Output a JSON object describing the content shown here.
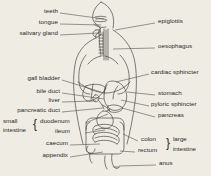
{
  "figure": {
    "background_color": "#efece4",
    "ink_color": "#2a2724",
    "orientation": "anterior view of human torso with alimentary canal"
  },
  "labels_left": [
    {
      "id": "teeth",
      "text": "teeth",
      "x": 40,
      "y": 11,
      "leader_to_x": 104,
      "leader_to_y": 19
    },
    {
      "id": "tongue",
      "text": "tongue",
      "x": 36,
      "y": 22,
      "leader_to_x": 101,
      "leader_to_y": 25
    },
    {
      "id": "salivary-gland",
      "text": "salivary gland",
      "x": 11,
      "y": 33,
      "leader_to_x": 99,
      "leader_to_y": 33
    },
    {
      "id": "gall-bladder",
      "text": "gall bladder",
      "x": 17,
      "y": 78,
      "leader_to_x": 101,
      "leader_to_y": 92
    },
    {
      "id": "bile-duct",
      "text": "bile duct",
      "x": 30,
      "y": 91,
      "leader_to_x": 104,
      "leader_to_y": 99
    },
    {
      "id": "liver",
      "text": "liver",
      "x": 44,
      "y": 100,
      "leader_to_x": 96,
      "leader_to_y": 101
    },
    {
      "id": "pancreatic-duct",
      "text": "pancreatic duct",
      "x": 9,
      "y": 110,
      "leader_to_x": 103,
      "leader_to_y": 108
    },
    {
      "id": "caecum",
      "text": "caecum",
      "x": 36,
      "y": 143,
      "leader_to_x": 100,
      "leader_to_y": 144
    },
    {
      "id": "appendix",
      "text": "appendix",
      "x": 30,
      "y": 155,
      "leader_to_x": 103,
      "leader_to_y": 152
    }
  ],
  "labels_right": [
    {
      "id": "epiglottis",
      "text": "epiglottis",
      "x": 159,
      "y": 21,
      "leader_to_x": 115,
      "leader_to_y": 30
    },
    {
      "id": "oesophagus",
      "text": "oesophagus",
      "x": 159,
      "y": 46,
      "leader_to_x": 113,
      "leader_to_y": 49
    },
    {
      "id": "cardiac-sphincter",
      "text": "cardiac sphincter",
      "x": 152,
      "y": 72,
      "leader_to_x": 116,
      "leader_to_y": 82
    },
    {
      "id": "stomach",
      "text": "stomach",
      "x": 159,
      "y": 93,
      "leader_to_x": 127,
      "leader_to_y": 92
    },
    {
      "id": "pyloric-sphincter",
      "text": "pyloric sphincter",
      "x": 152,
      "y": 104,
      "leader_to_x": 121,
      "leader_to_y": 100
    },
    {
      "id": "pancreas",
      "text": "pancreas",
      "x": 159,
      "y": 115,
      "leader_to_x": 122,
      "leader_to_y": 108
    },
    {
      "id": "anus",
      "text": "anus",
      "x": 160,
      "y": 163,
      "leader_to_x": 119,
      "leader_to_y": 166
    }
  ],
  "group_small_intestine": {
    "group_label_line1": "small",
    "group_label_line2": "intestine",
    "brace": "{",
    "members": [
      {
        "id": "duodenum",
        "text": "duodenum",
        "x": 48,
        "y": 121,
        "leader_to_x": 108,
        "leader_to_y": 114
      },
      {
        "id": "ileum",
        "text": "ileum",
        "x": 62,
        "y": 131,
        "leader_to_x": 105,
        "leader_to_y": 130
      }
    ]
  },
  "group_large_intestine": {
    "group_label_line1": "large",
    "group_label_line2": "intestine",
    "brace": "}",
    "members": [
      {
        "id": "colon",
        "text": "colon",
        "x": 143,
        "y": 139,
        "leader_to_x": 123,
        "leader_to_y": 134
      },
      {
        "id": "rectum",
        "text": "rectum",
        "x": 139,
        "y": 150,
        "leader_to_x": 120,
        "leader_to_y": 151
      }
    ]
  }
}
